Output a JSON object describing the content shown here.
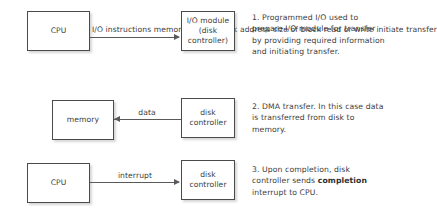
{
  "diagram": {
    "background_color": "#ffffff",
    "box_border_color": "#4a4a4a",
    "line_color": "#5a5a5a",
    "text_color": "#3d3d3d"
  },
  "rows": [
    {
      "id": "row-1",
      "source_box": {
        "name": "cpu",
        "lines": [
          "CPU"
        ]
      },
      "target_box": {
        "name": "io-module",
        "lines": [
          "I/O module",
          "(disk controller)"
        ]
      },
      "arrow": {
        "direction": "right",
        "label_lines": [
          "I/O instructions",
          "memory address",
          "disk address",
          "size of block",
          "read or write",
          "initiate transfer"
        ]
      },
      "note": {
        "number": "1.",
        "text_before_bold": "1. Programmed I/O used to prepare I/O module for transfer by providing required information and initiating transfer.",
        "bold": "",
        "text_after_bold": ""
      }
    },
    {
      "id": "row-2",
      "source_box": {
        "name": "disk-controller",
        "lines": [
          "disk",
          "controller"
        ]
      },
      "target_box": {
        "name": "memory",
        "lines": [
          "memory"
        ]
      },
      "arrow": {
        "direction": "left",
        "label_lines": [
          "data"
        ]
      },
      "note": {
        "number": "2.",
        "text_before_bold": "2. DMA transfer. In this case data is transferred from disk to memory.",
        "bold": "",
        "text_after_bold": ""
      }
    },
    {
      "id": "row-3",
      "source_box": {
        "name": "cpu",
        "lines": [
          "CPU"
        ]
      },
      "target_box": {
        "name": "disk-controller",
        "lines": [
          "disk",
          "controller"
        ]
      },
      "arrow": {
        "direction": "right",
        "label_lines": [
          "interrupt"
        ]
      },
      "note": {
        "number": "3.",
        "text_before_bold": "3. Upon completion, disk controller sends ",
        "bold": "completion",
        "text_after_bold": " interrupt to CPU."
      }
    }
  ],
  "boxes": {
    "cpu_1": "CPU",
    "io_module_line1": "I/O module",
    "io_module_line2": "(disk controller)",
    "memory": "memory",
    "disk_controller_2_line1": "disk",
    "disk_controller_2_line2": "controller",
    "cpu_3": "CPU",
    "disk_controller_3_line1": "disk",
    "disk_controller_3_line2": "controller"
  },
  "edge_labels": {
    "row1_line1": "I/O instructions",
    "row1_line2": "memory address",
    "row1_line3": "disk address",
    "row1_line4": "size of block",
    "row1_line5": "read or write",
    "row1_line6": "initiate transfer",
    "row2_line1": "data",
    "row3_line1": "interrupt"
  },
  "notes": {
    "note1": "1. Programmed I/O used to prepare I/O module for transfer by providing required information and initiating transfer.",
    "note2": "2. DMA transfer. In this case data is transferred from disk to memory.",
    "note3_part1": "3. Upon completion, disk controller sends ",
    "note3_bold": "completion",
    "note3_part2": " interrupt to CPU."
  }
}
